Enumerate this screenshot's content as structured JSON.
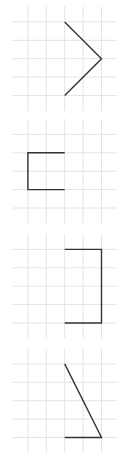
{
  "colors": {
    "grid": "#e4e4e4",
    "stroke": "#333333",
    "background": "#ffffff"
  },
  "grid": {
    "columns": 5,
    "rows": 5,
    "cell_units": 1
  },
  "panels": [
    {
      "name": "chevron-right",
      "points": [
        [
          3,
          1
        ],
        [
          5,
          3
        ],
        [
          3,
          5
        ]
      ]
    },
    {
      "name": "bracket-left",
      "points": [
        [
          3,
          2
        ],
        [
          1,
          2
        ],
        [
          1,
          4
        ],
        [
          3,
          4
        ]
      ]
    },
    {
      "name": "bracket-right",
      "points": [
        [
          3,
          1
        ],
        [
          5,
          1
        ],
        [
          5,
          5
        ],
        [
          3,
          5
        ]
      ]
    },
    {
      "name": "triangle-open",
      "points": [
        [
          3,
          1
        ],
        [
          5,
          5
        ],
        [
          3,
          5
        ]
      ]
    }
  ]
}
